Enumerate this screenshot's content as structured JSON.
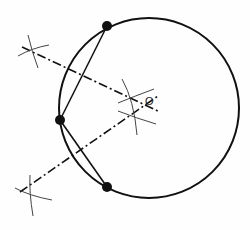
{
  "diagram": {
    "circle": {
      "cx": 149,
      "cy": 108,
      "r": 90,
      "stroke": "#111111"
    },
    "points": [
      {
        "id": "A",
        "x": 107,
        "y": 26
      },
      {
        "id": "B",
        "x": 60,
        "y": 120
      },
      {
        "id": "C",
        "x": 107,
        "y": 187
      }
    ],
    "chords": [
      {
        "from": "A",
        "to": "B"
      },
      {
        "from": "B",
        "to": "C"
      }
    ],
    "bisectors": [
      {
        "x1": 22,
        "y1": 47,
        "x2": 160,
        "y2": 112
      },
      {
        "x1": 20,
        "y1": 192,
        "x2": 158,
        "y2": 96
      }
    ],
    "center_label": {
      "text": "O",
      "x": 145,
      "y": 105
    },
    "colors": {
      "line": "#111111",
      "arc": "#333333",
      "background": "#fefefe"
    }
  }
}
